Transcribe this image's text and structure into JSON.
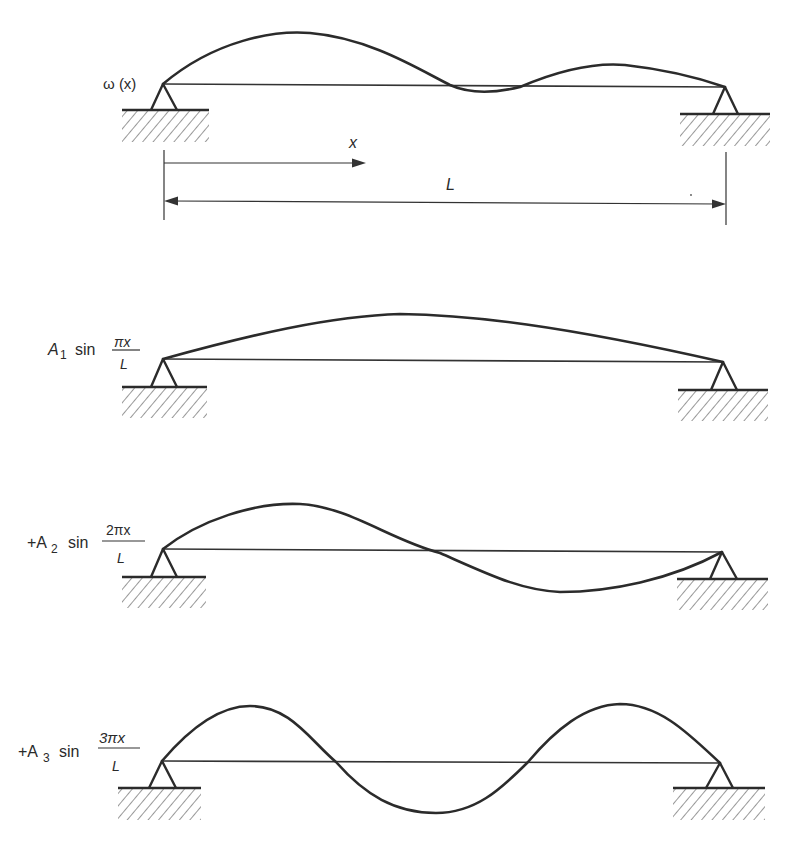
{
  "figure": {
    "panels": [
      {
        "id": "general-deflection",
        "label": "ω (x)",
        "dimensions": {
          "x_label": "x",
          "L_label": "L"
        }
      },
      {
        "id": "mode-1",
        "label_prefix": "A",
        "label_sub": "1",
        "label_func": "sin",
        "frac_num": "πx",
        "frac_den": "L"
      },
      {
        "id": "mode-2",
        "label_prefix": "+A",
        "label_sub": "2",
        "label_func": "sin",
        "frac_num": "2πx",
        "frac_den": "L"
      },
      {
        "id": "mode-3",
        "label_prefix": "+A",
        "label_sub": "3",
        "label_func": "sin",
        "frac_num": "3πx",
        "frac_den": "L"
      }
    ],
    "caption": "",
    "colors": {
      "ink": "#2b2b2b",
      "background": "#ffffff"
    }
  }
}
